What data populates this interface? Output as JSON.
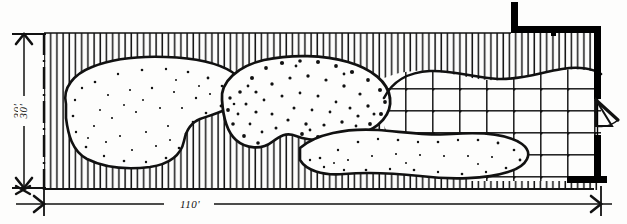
{
  "drawing": {
    "type": "landscape-site-plan",
    "title": "",
    "style": "hand-drawn ink plan view",
    "background_color": "#fdfdfc",
    "ink_color": "#111111"
  },
  "dimensions": {
    "vertical": {
      "label": "30'",
      "value": 30,
      "unit": "feet",
      "orientation": "vertical",
      "position": "left"
    },
    "horizontal": {
      "label": "110'",
      "value": 110,
      "unit": "feet",
      "orientation": "horizontal",
      "position": "bottom"
    }
  },
  "site": {
    "boundary": {
      "name": "property-line",
      "line_style": "dash-dot",
      "color": "#111111"
    },
    "ground_texture": {
      "name": "vertical-hatch-fill",
      "description": "dense vertical line hatching representing planting / ground cover",
      "color": "#1a1a1a"
    }
  },
  "features": [
    {
      "name": "lawn-area-west",
      "label": "",
      "texture": "light-stipple",
      "description": "large kidney-shaped open lawn at west end"
    },
    {
      "name": "gravel-bed-center",
      "label": "",
      "texture": "dense-stipple",
      "description": "heavily stippled rounded planting / gravel bed at center"
    },
    {
      "name": "paving-grid-east",
      "label": "",
      "texture": "grid",
      "description": "rectangular paving grid with joint dots at east end"
    },
    {
      "name": "lawn-area-southeast",
      "label": "",
      "texture": "light-stipple",
      "description": "elongated stippled bed along south-east edge"
    }
  ],
  "building": {
    "name": "building-wall",
    "description": "heavy poche wall forming corner at upper right and east edge",
    "color": "#000000",
    "door": {
      "name": "door-swing",
      "description": "door opening with quarter-arc swing on east wall"
    }
  },
  "colors": {
    "ink": "#111111",
    "poche": "#000000",
    "paper": "#fdfdfc"
  }
}
